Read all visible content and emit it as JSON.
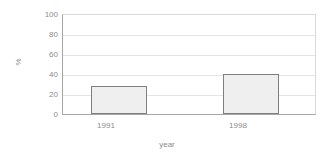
{
  "chart_data": {
    "type": "bar",
    "title": "",
    "subtitle": "",
    "categories": [
      "1991",
      "1998"
    ],
    "values": [
      28,
      40
    ],
    "series": [
      {
        "name": "%",
        "values": [
          28,
          40
        ]
      }
    ],
    "xlabel": "year",
    "ylabel": "%",
    "ylim": [
      0,
      100
    ],
    "yticks": [
      "0",
      "20",
      "40",
      "60",
      "80",
      "100"
    ],
    "ytick_values": [
      0,
      20,
      40,
      60,
      80,
      100
    ],
    "grid": "horizontal",
    "legend": "none",
    "annotations": [],
    "colors": {
      "bar_fill": "#efefef",
      "bar_border": "#7f7f7f",
      "gridline": "#e4e4e4",
      "axis": "#a6a6a6",
      "frame": "#d9d9d9",
      "text": "#8c8c8c",
      "background": "#ffffff"
    }
  },
  "axes": {
    "y": {
      "title": "%",
      "ticks": [
        {
          "label": "100",
          "value": 100
        },
        {
          "label": "80",
          "value": 80
        },
        {
          "label": "60",
          "value": 60
        },
        {
          "label": "40",
          "value": 40
        },
        {
          "label": "20",
          "value": 20
        },
        {
          "label": "0",
          "value": 0
        }
      ]
    },
    "x": {
      "title": "year",
      "ticks": [
        {
          "label": "1991"
        },
        {
          "label": "1998"
        }
      ]
    }
  }
}
